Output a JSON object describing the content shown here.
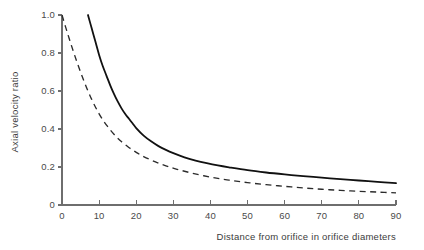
{
  "chart_data": {
    "type": "line",
    "title": "",
    "xlabel": "Distance from orifice in orifice diameters",
    "ylabel": "Axial velocity ratio",
    "xlim": [
      0,
      90
    ],
    "ylim": [
      0,
      1.0
    ],
    "grid": false,
    "legend": "none",
    "xticks": [
      0,
      10,
      20,
      30,
      40,
      50,
      60,
      70,
      80,
      90
    ],
    "xtick_labels": [
      "0",
      "10",
      "20",
      "30",
      "40",
      "50",
      "60",
      "70",
      "80",
      "90"
    ],
    "yticks": [
      0,
      0.2,
      0.4,
      0.6,
      0.8,
      1.0
    ],
    "ytick_labels": [
      "0",
      "0.2",
      "0.4",
      "0.6",
      "0.8",
      "1.0"
    ],
    "series": [
      {
        "name": "solid-curve",
        "style": "solid",
        "color": "#111111",
        "x": [
          7,
          8,
          9,
          10,
          11,
          12,
          13,
          14,
          15,
          16,
          17,
          18,
          19,
          20,
          22,
          24,
          26,
          28,
          30,
          33,
          36,
          39,
          42,
          45,
          50,
          55,
          60,
          65,
          70,
          75,
          80,
          85,
          90
        ],
        "y": [
          1.0,
          0.93,
          0.86,
          0.79,
          0.73,
          0.68,
          0.63,
          0.585,
          0.545,
          0.51,
          0.48,
          0.455,
          0.43,
          0.405,
          0.365,
          0.335,
          0.31,
          0.29,
          0.273,
          0.251,
          0.234,
          0.22,
          0.208,
          0.198,
          0.183,
          0.171,
          0.161,
          0.152,
          0.144,
          0.136,
          0.129,
          0.122,
          0.115
        ]
      },
      {
        "name": "dashed-curve",
        "style": "dashed",
        "color": "#2b2b2b",
        "x": [
          0,
          1,
          2,
          3,
          4,
          5,
          6,
          7,
          8,
          9,
          10,
          11,
          12,
          13,
          14,
          15,
          16,
          18,
          20,
          22,
          25,
          28,
          31,
          35,
          40,
          45,
          50,
          55,
          60,
          65,
          70,
          75,
          80,
          85,
          90
        ],
        "y": [
          1.0,
          0.935,
          0.872,
          0.812,
          0.754,
          0.7,
          0.648,
          0.6,
          0.556,
          0.516,
          0.48,
          0.448,
          0.42,
          0.395,
          0.372,
          0.352,
          0.334,
          0.303,
          0.277,
          0.255,
          0.228,
          0.206,
          0.188,
          0.168,
          0.147,
          0.131,
          0.118,
          0.107,
          0.098,
          0.09,
          0.083,
          0.077,
          0.072,
          0.068,
          0.064
        ]
      }
    ]
  },
  "axes_geometry": {
    "left_px": 62,
    "right_px": 396,
    "top_px": 15,
    "bottom_px": 205
  }
}
